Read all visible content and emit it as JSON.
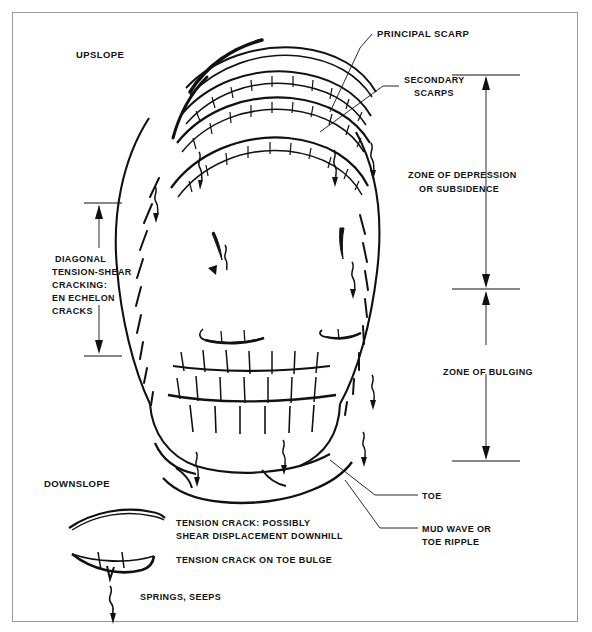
{
  "figure": {
    "background_color": "#ffffff",
    "line_color": "#111111",
    "border_color": "#9a9a9a"
  },
  "orientation_labels": {
    "upslope": "UPSLOPE",
    "downslope": "DOWNSLOPE"
  },
  "callouts": {
    "principal_scarp": "PRINCIPAL SCARP",
    "secondary_scarps_line1": "SECONDARY",
    "secondary_scarps_line2": "SCARPS",
    "toe": "TOE",
    "mud_wave_line1": "MUD WAVE OR",
    "mud_wave_line2": "TOE RIPPLE"
  },
  "zones": {
    "depression_line1": "ZONE OF DEPRESSION",
    "depression_line2": "OR SUBSIDENCE",
    "bulging": "ZONE OF BULGING"
  },
  "left_annotation": {
    "line1": "DIAGONAL",
    "line2": "TENSION-SHEAR",
    "line3": "CRACKING:",
    "line4": "EN ECHELON",
    "line5": "CRACKS"
  },
  "legend": {
    "items": [
      {
        "symbol": "arc-double-curve-symbol",
        "line1": "TENSION CRACK:  POSSIBLY",
        "line2": "SHEAR DISPLACEMENT DOWNHILL"
      },
      {
        "symbol": "lens-spike-symbol",
        "line1": "TENSION CRACK ON TOE BULGE",
        "line2": ""
      },
      {
        "symbol": "wavy-arrow-symbol",
        "line1": "SPRINGS, SEEPS",
        "line2": ""
      }
    ]
  }
}
